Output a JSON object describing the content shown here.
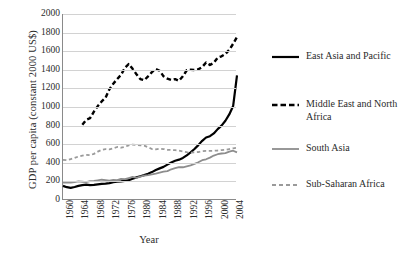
{
  "chart_data": {
    "type": "line",
    "title": "",
    "xlabel": "Year",
    "ylabel": "GDP per capita (constant 2000 US$)",
    "xlim": [
      1960,
      2005
    ],
    "ylim": [
      0,
      2000
    ],
    "ytick_step": 200,
    "grid": "horizontal",
    "legend_position": "right",
    "ytick_labels": [
      "2000",
      "1800",
      "1600",
      "1400",
      "1200",
      "1000",
      "800",
      "600",
      "400",
      "200",
      "0"
    ],
    "xtick_labels": [
      "1960",
      "1964",
      "1968",
      "1972",
      "1976",
      "1980",
      "1984",
      "1988",
      "1992",
      "1996",
      "2000",
      "2004"
    ],
    "series": [
      {
        "name": "East Asia and Pacific",
        "style": "solid",
        "color": "#000000",
        "width": 2.2,
        "x": [
          1960,
          1961,
          1962,
          1963,
          1964,
          1965,
          1966,
          1967,
          1968,
          1969,
          1970,
          1971,
          1972,
          1973,
          1974,
          1975,
          1976,
          1977,
          1978,
          1979,
          1980,
          1981,
          1982,
          1983,
          1984,
          1985,
          1986,
          1987,
          1988,
          1989,
          1990,
          1991,
          1992,
          1993,
          1994,
          1995,
          1996,
          1997,
          1998,
          1999,
          2000,
          2001,
          2002,
          2003,
          2004,
          2005
        ],
        "y": [
          152,
          138,
          131,
          140,
          152,
          160,
          165,
          160,
          163,
          168,
          173,
          176,
          181,
          192,
          196,
          200,
          205,
          214,
          228,
          243,
          256,
          268,
          282,
          300,
          322,
          340,
          356,
          380,
          404,
          422,
          434,
          452,
          480,
          512,
          548,
          590,
          636,
          672,
          686,
          716,
          762,
          800,
          852,
          920,
          1010,
          1340
        ]
      },
      {
        "name": "Middle East and North Africa",
        "style": "dashed",
        "color": "#000000",
        "width": 2.4,
        "x": [
          1965,
          1966,
          1967,
          1968,
          1969,
          1970,
          1971,
          1972,
          1973,
          1974,
          1975,
          1976,
          1977,
          1978,
          1979,
          1980,
          1981,
          1982,
          1983,
          1984,
          1985,
          1986,
          1987,
          1988,
          1989,
          1990,
          1991,
          1992,
          1993,
          1994,
          1995,
          1996,
          1997,
          1998,
          1999,
          2000,
          2001,
          2002,
          2003,
          2004,
          2005
        ],
        "y": [
          810,
          862,
          880,
          950,
          1010,
          1060,
          1100,
          1190,
          1250,
          1300,
          1345,
          1420,
          1462,
          1410,
          1352,
          1300,
          1288,
          1330,
          1375,
          1408,
          1390,
          1330,
          1305,
          1290,
          1300,
          1282,
          1330,
          1395,
          1400,
          1398,
          1405,
          1430,
          1478,
          1452,
          1475,
          1530,
          1545,
          1570,
          1615,
          1680,
          1752
        ]
      },
      {
        "name": "South Asia",
        "style": "solid",
        "color": "#8d8d8d",
        "width": 1.8,
        "x": [
          1960,
          1961,
          1962,
          1963,
          1964,
          1965,
          1966,
          1967,
          1968,
          1969,
          1970,
          1971,
          1972,
          1973,
          1974,
          1975,
          1976,
          1977,
          1978,
          1979,
          1980,
          1981,
          1982,
          1983,
          1984,
          1985,
          1986,
          1987,
          1988,
          1989,
          1990,
          1991,
          1992,
          1993,
          1994,
          1995,
          1996,
          1997,
          1998,
          1999,
          2000,
          2001,
          2002,
          2003,
          2004,
          2005
        ],
        "y": [
          186,
          188,
          186,
          192,
          200,
          196,
          192,
          202,
          206,
          212,
          218,
          214,
          208,
          215,
          214,
          226,
          224,
          236,
          248,
          238,
          252,
          262,
          268,
          276,
          284,
          294,
          304,
          310,
          330,
          342,
          354,
          352,
          362,
          372,
          388,
          406,
          428,
          438,
          456,
          478,
          492,
          500,
          505,
          520,
          530,
          512
        ]
      },
      {
        "name": "Sub-Saharan Africa",
        "style": "dashed",
        "color": "#9a9a9a",
        "width": 1.8,
        "x": [
          1960,
          1961,
          1962,
          1963,
          1964,
          1965,
          1966,
          1967,
          1968,
          1969,
          1970,
          1971,
          1972,
          1973,
          1974,
          1975,
          1976,
          1977,
          1978,
          1979,
          1980,
          1981,
          1982,
          1983,
          1984,
          1985,
          1986,
          1987,
          1988,
          1989,
          1990,
          1991,
          1992,
          1993,
          1994,
          1995,
          1996,
          1997,
          1998,
          1999,
          2000,
          2001,
          2002,
          2003,
          2004,
          2005
        ],
        "y": [
          432,
          428,
          440,
          452,
          468,
          478,
          486,
          482,
          496,
          520,
          540,
          548,
          545,
          556,
          570,
          562,
          572,
          588,
          596,
          592,
          588,
          584,
          568,
          548,
          545,
          552,
          548,
          540,
          538,
          536,
          530,
          522,
          514,
          510,
          512,
          516,
          524,
          528,
          528,
          530,
          532,
          536,
          540,
          548,
          556,
          562
        ]
      }
    ]
  },
  "legend": {
    "items": [
      {
        "label": "East Asia and Pacific",
        "icon": "solid-black-line-icon"
      },
      {
        "label": "Middle East and North Africa",
        "icon": "dashed-black-line-icon"
      },
      {
        "label": "South Asia",
        "icon": "solid-gray-line-icon"
      },
      {
        "label": "Sub-Saharan Africa",
        "icon": "dashed-gray-line-icon"
      }
    ]
  }
}
